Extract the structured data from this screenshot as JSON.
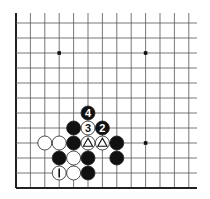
{
  "diagram": {
    "grid": {
      "cols": 13,
      "rows": 12,
      "origin_x": 16,
      "origin_y": 23,
      "spacing_x": 14.4,
      "spacing_y": 15,
      "line_extend_right": 197,
      "line_extend_top": 13,
      "edges": {
        "left": true,
        "bottom": true,
        "top": false,
        "right": false
      },
      "line_color": "#555555",
      "edge_color": "#222222"
    },
    "star_points": [
      {
        "col": 3,
        "row": 2
      },
      {
        "col": 9,
        "row": 2
      },
      {
        "col": 9,
        "row": 8
      }
    ],
    "stones": [
      {
        "col": 5,
        "row": 6,
        "color": "black",
        "label": "4"
      },
      {
        "col": 4,
        "row": 7,
        "color": "black",
        "label": ""
      },
      {
        "col": 5,
        "row": 7,
        "color": "white",
        "label": "3"
      },
      {
        "col": 6,
        "row": 7,
        "color": "black",
        "label": "2"
      },
      {
        "col": 2,
        "row": 8,
        "color": "white",
        "label": ""
      },
      {
        "col": 3,
        "row": 8,
        "color": "white",
        "label": ""
      },
      {
        "col": 4,
        "row": 8,
        "color": "black",
        "label": ""
      },
      {
        "col": 5,
        "row": 8,
        "color": "white",
        "label": "",
        "mark": "triangle"
      },
      {
        "col": 6,
        "row": 8,
        "color": "white",
        "label": "",
        "mark": "triangle"
      },
      {
        "col": 7,
        "row": 8,
        "color": "black",
        "label": ""
      },
      {
        "col": 3,
        "row": 9,
        "color": "black",
        "label": ""
      },
      {
        "col": 4,
        "row": 9,
        "color": "white",
        "label": ""
      },
      {
        "col": 5,
        "row": 9,
        "color": "black",
        "label": ""
      },
      {
        "col": 7,
        "row": 9,
        "color": "black",
        "label": ""
      },
      {
        "col": 3,
        "row": 10,
        "color": "white",
        "label": "1"
      },
      {
        "col": 4,
        "row": 10,
        "color": "white",
        "label": ""
      },
      {
        "col": 5,
        "row": 10,
        "color": "black",
        "label": ""
      }
    ],
    "colors": {
      "black_stone": "#111111",
      "white_stone": "#ffffff",
      "stone_outline": "#222222"
    }
  }
}
